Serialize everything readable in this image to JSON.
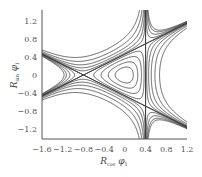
{
  "chart_data": {
    "type": "contour",
    "title": "",
    "xlabel": "R_cos φ1",
    "ylabel": "R_sin φ1",
    "xlabel_parts": {
      "main": "R",
      "sub": "cos",
      "tail": " φ",
      "tail_sub": "1"
    },
    "ylabel_parts": {
      "main": "R",
      "sub": "sin",
      "tail": " φ",
      "tail_sub": "1"
    },
    "xlim": [
      -1.6,
      1.2
    ],
    "ylim": [
      -1.42,
      1.44
    ],
    "x_ticks": [
      -1.6,
      -1.2,
      -0.8,
      -0.4,
      0,
      0.4,
      0.8,
      1.2
    ],
    "x_tick_labels": [
      "−1.6",
      "−1.2",
      "−0.8",
      "−0.4",
      "0",
      "0.4",
      "0.8",
      "1.2"
    ],
    "y_ticks": [
      1.2,
      0.8,
      0.4,
      0,
      -0.4,
      -0.8,
      -1.2
    ],
    "y_tick_labels": [
      "1.2",
      "0.8",
      "0.4",
      "0",
      "−0.4",
      "−0.8",
      "−1.2"
    ],
    "grid": false,
    "legend": null,
    "function": {
      "form": "x^2 + y^2 + c*(x^3 - 3*x*y^2)",
      "c": 0.8333
    },
    "separatrix_level": 0.2133,
    "contour_levels": [
      0.03,
      0.075,
      0.13,
      0.18,
      0.2133,
      0.24,
      0.29,
      0.37,
      0.5,
      0.7
    ],
    "features": {
      "saddle_points": [
        [
          -0.8,
          0
        ],
        [
          0.4,
          0.693
        ],
        [
          0.4,
          -0.693
        ]
      ],
      "center": [
        0,
        0
      ],
      "separatrix_lines": [
        "x = 0.4",
        "line through (-0.8,0) and (0.4,0.693)",
        "line through (-0.8,0) and (0.4,-0.693)"
      ]
    },
    "colors": {
      "curve": "#3a3a3a",
      "axis": "#555555",
      "text": "#555555"
    }
  },
  "layout": {
    "plot_px": {
      "left": 42,
      "right": 187,
      "top": 10,
      "bottom": 139
    },
    "x_to_px": {
      "x0": -1.6,
      "px0": 42,
      "x1": 1.2,
      "px1": 187
    },
    "y_to_px": {
      "y0": 0,
      "py0": 75,
      "px_per_unit": 45
    }
  }
}
